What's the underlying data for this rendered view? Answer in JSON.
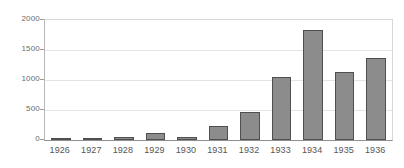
{
  "chart_data": {
    "type": "bar",
    "title": "",
    "subtitle": "",
    "xlabel": "",
    "ylabel": "",
    "categories": [
      "1926",
      "1927",
      "1928",
      "1929",
      "1930",
      "1931",
      "1932",
      "1933",
      "1934",
      "1935",
      "1936"
    ],
    "values": [
      15,
      10,
      55,
      125,
      55,
      230,
      460,
      1055,
      1840,
      1140,
      1375
    ],
    "series": [
      {
        "name": "",
        "values": [
          15,
          10,
          55,
          125,
          55,
          230,
          460,
          1055,
          1840,
          1140,
          1375
        ]
      }
    ],
    "ylim": [
      0,
      2000
    ],
    "yticks": [
      0,
      500,
      1000,
      1500,
      2000
    ],
    "ytick_labels": [
      "0",
      "500",
      "1000",
      "1500",
      "2000"
    ],
    "grid": true,
    "grid_axis": "y",
    "legend": false,
    "legend_position": "none",
    "annotations": [],
    "colors": {
      "bar_fill": "#8c8c8c",
      "bar_border": "#4f4f4f",
      "gridline": "#e4e4e4",
      "axis": "#8f8f8f",
      "tick_text": "#6b6b6b",
      "category_text": "#555555",
      "background": "#ffffff"
    }
  }
}
